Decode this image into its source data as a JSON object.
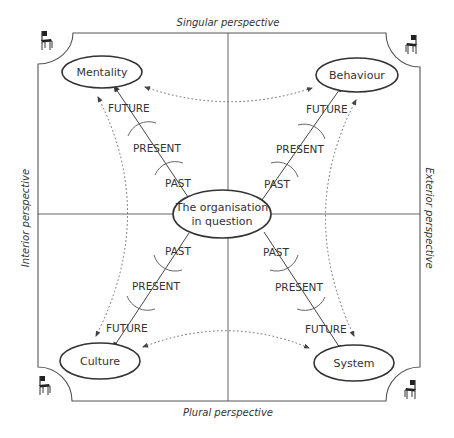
{
  "diagram": {
    "perspectives": {
      "top": "Singular perspective",
      "bottom": "Plural perspective",
      "left": "Interior perspective",
      "right": "Exterior perspective"
    },
    "center": {
      "line1": "The organisation",
      "line2": "in question"
    },
    "quadrants": {
      "top_left": "Mentality",
      "top_right": "Behaviour",
      "bottom_left": "Culture",
      "bottom_right": "System"
    },
    "time_labels": {
      "past": "PAST",
      "present": "PRESENT",
      "future": "FUTURE"
    },
    "corner_icons": [
      "chair-icon",
      "chair-icon",
      "chair-icon",
      "chair-icon"
    ],
    "colors": {
      "line": "#444444",
      "text": "#333333",
      "background": "#ffffff"
    }
  }
}
